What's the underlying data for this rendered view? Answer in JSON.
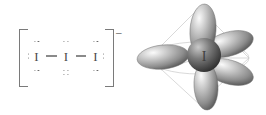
{
  "figure": {
    "species_name": "triiodide ion",
    "formula": "I3-",
    "charge_label": "–"
  },
  "lewis": {
    "central_symbol": "I",
    "atoms": [
      {
        "symbol": "I",
        "lone_pairs": 3,
        "position": "terminal-left"
      },
      {
        "symbol": "I",
        "lone_pairs": 3,
        "position": "central"
      },
      {
        "symbol": "I",
        "lone_pairs": 3,
        "position": "terminal-right"
      }
    ],
    "bonds": [
      {
        "from": 0,
        "to": 1,
        "order": 1
      },
      {
        "from": 1,
        "to": 2,
        "order": 1
      }
    ],
    "bracket_charge": "–",
    "colors": {
      "atom_text": "#4a4a4a",
      "dots": "#6b6b6b",
      "bond": "#8a8a8a",
      "bracket": "#7a7a7a"
    }
  },
  "model": {
    "center_atom_label": "I",
    "geometry": "trigonal bipyramidal",
    "lobe_count": 5,
    "lobes": [
      {
        "name": "axial-top",
        "direction": "up"
      },
      {
        "name": "axial-bottom",
        "direction": "down"
      },
      {
        "name": "equatorial-left",
        "direction": "left"
      },
      {
        "name": "equatorial-upper-right",
        "direction": "upper-right"
      },
      {
        "name": "equatorial-lower-right",
        "direction": "lower-right"
      }
    ],
    "wireframe": "trigonal bipyramid cage",
    "colors": {
      "lobe_light": "#f2f2f2",
      "lobe_mid": "#9b9b9b",
      "lobe_dark": "#5d5d5d",
      "sphere_light": "#b9b9b9",
      "sphere_dark": "#3a3a3a",
      "wireframe": "#c9c9c9",
      "center_label": "#3f3f3f"
    }
  }
}
